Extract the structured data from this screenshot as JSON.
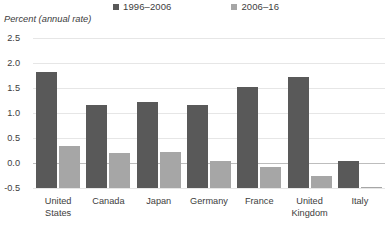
{
  "axis_title": "Percent (annual rate)",
  "legend": {
    "items": [
      {
        "label": "1996–2006",
        "color": "#595959",
        "name": "legend-series-1996-2006"
      },
      {
        "label": "2006–16",
        "color": "#a6a6a6",
        "name": "legend-series-2006-16"
      }
    ]
  },
  "colors": {
    "series1": "#595959",
    "series2": "#a6a6a6",
    "gridline": "#e6e6e6",
    "zeroline": "#bdbdbd",
    "text": "#3d3d3d",
    "background": "#ffffff"
  },
  "yticks": [
    "2.5",
    "2.0",
    "1.5",
    "1.0",
    "0.5",
    "0.0",
    "-0.5"
  ],
  "xlabels": [
    "United\nStates",
    "Canada",
    "Japan",
    "Germany",
    "France",
    "United\nKingdom",
    "Italy"
  ],
  "chart_data": {
    "type": "bar",
    "title": "",
    "subtitle": "",
    "xlabel": "",
    "ylabel": "Percent (annual rate)",
    "categories": [
      "United States",
      "Canada",
      "Japan",
      "Germany",
      "France",
      "United Kingdom",
      "Italy"
    ],
    "series": [
      {
        "name": "1996–2006",
        "color": "#595959",
        "values": [
          2.32,
          1.66,
          1.73,
          1.67,
          2.03,
          2.22,
          0.55
        ]
      },
      {
        "name": "2006–16",
        "color": "#a6a6a6",
        "values": [
          0.84,
          0.71,
          0.72,
          0.55,
          0.43,
          0.25,
          0.01
        ]
      }
    ],
    "ylim": [
      -0.5,
      2.5
    ],
    "ytick_values": [
      2.5,
      2.0,
      1.5,
      1.0,
      0.5,
      0.0,
      -0.5
    ],
    "grid": true,
    "legend_position": "top"
  }
}
